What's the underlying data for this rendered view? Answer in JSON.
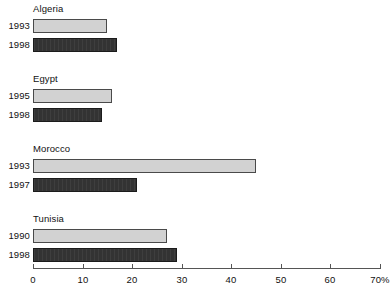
{
  "chart_data": {
    "type": "bar",
    "orientation": "horizontal",
    "title": "",
    "subtitle": "",
    "xlabel": "",
    "ylabel": "",
    "xlim": [
      0,
      70
    ],
    "xunit": "%",
    "grid": false,
    "legend": null,
    "axis": {
      "ticks": [
        0,
        10,
        20,
        30,
        40,
        50,
        60,
        70
      ],
      "tick_labels": [
        "0",
        "10",
        "20",
        "30",
        "40",
        "50",
        "60",
        "70%"
      ]
    },
    "groups": [
      {
        "name": "Algeria",
        "bars": [
          {
            "label": "1993",
            "value": 15,
            "style": "light"
          },
          {
            "label": "1998",
            "value": 17,
            "style": "dark"
          }
        ]
      },
      {
        "name": "Egypt",
        "bars": [
          {
            "label": "1995",
            "value": 16,
            "style": "light"
          },
          {
            "label": "1998",
            "value": 14,
            "style": "dark"
          }
        ]
      },
      {
        "name": "Morocco",
        "bars": [
          {
            "label": "1993",
            "value": 45,
            "style": "light"
          },
          {
            "label": "1997",
            "value": 21,
            "style": "dark"
          }
        ]
      },
      {
        "name": "Tunisia",
        "bars": [
          {
            "label": "1990",
            "value": 27,
            "style": "light"
          },
          {
            "label": "1998",
            "value": 29,
            "style": "dark"
          }
        ]
      }
    ],
    "colors": {
      "light_bar_fill": "#d2d2d2",
      "light_bar_border": "#4a4a4a",
      "dark_bar_fill": "#333333",
      "dark_bar_border": "#1b1b1b",
      "axis": "#555555",
      "text": "#111111",
      "background": "#ffffff"
    }
  }
}
